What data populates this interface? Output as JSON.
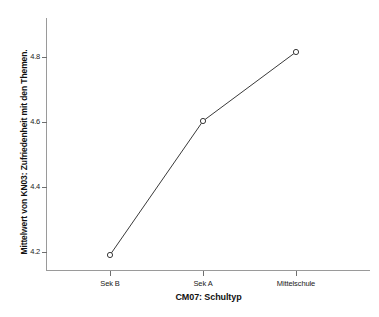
{
  "chart_data": {
    "type": "line",
    "title": "",
    "subtitle": "",
    "xlabel": "CM07: Schultyp",
    "ylabel": "Mittelwert von KN03: Zufriedenheit mit den Themen.",
    "categories": [
      "Sek B",
      "Sek A",
      "Mittelschule"
    ],
    "values": [
      4.21,
      4.62,
      4.83
    ],
    "series": [
      {
        "name": "Mittelwert von KN03: Zufriedenheit mit den Themen.",
        "values": [
          4.21,
          4.62,
          4.83
        ]
      }
    ],
    "ylim": [
      4.13,
      4.88
    ],
    "yticks": [
      4.2,
      4.4,
      4.6,
      4.8
    ],
    "ytick_labels": [
      "4.2",
      "4.4",
      "4.6",
      "4.8"
    ],
    "xtick_labels": [
      "Sek B",
      "Sek A",
      "Mittelschule"
    ],
    "grid": false,
    "legend": false,
    "legend_position": "none",
    "marker": "open-circle",
    "line_color": "#3a3a3a",
    "marker_color": "#3a3a3a",
    "axis_color": "#9a9a9a",
    "background_color": "#ffffff",
    "text_color": "#111111"
  },
  "axes": {
    "y_title": "Mittelwert von KN03: Zufriedenheit mit den Themen.",
    "x_title": "CM07: Schultyp",
    "y_ticks": [
      {
        "label": "4.8",
        "top": 57
      },
      {
        "label": "4.6",
        "top": 122
      },
      {
        "label": "4.4",
        "top": 187
      },
      {
        "label": "4.2",
        "top": 252
      }
    ],
    "x_ticks": [
      {
        "label": "Sek B",
        "left": 110
      },
      {
        "label": "Sek A",
        "left": 203
      },
      {
        "label": "Mittelschule",
        "left": 296
      }
    ]
  },
  "points": [
    {
      "category": "Sek B",
      "value": "4.21",
      "cx": 110,
      "cy": 255
    },
    {
      "category": "Sek A",
      "value": "4.62",
      "cx": 203,
      "cy": 121
    },
    {
      "category": "Mittelschule",
      "value": "4.83",
      "cx": 296,
      "cy": 52
    }
  ]
}
